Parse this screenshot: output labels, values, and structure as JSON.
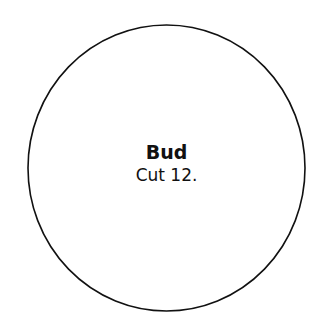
{
  "shape": {
    "type": "circle",
    "stroke_color": "#111111",
    "fill_color": "#ffffff"
  },
  "label": {
    "title": "Bud",
    "subtitle": "Cut 12."
  }
}
